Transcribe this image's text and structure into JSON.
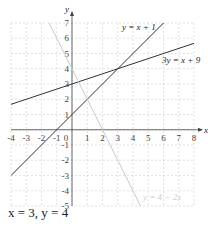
{
  "chart_data": {
    "type": "line",
    "title": "",
    "xlabel": "x",
    "ylabel": "y",
    "xlim": [
      -4,
      8
    ],
    "ylim": [
      -5,
      7
    ],
    "grid": true,
    "x_ticks": [
      -4,
      -3,
      -2,
      -1,
      0,
      1,
      2,
      3,
      4,
      5,
      6,
      7,
      8
    ],
    "y_ticks": [
      -5,
      -4,
      -3,
      -2,
      -1,
      1,
      2,
      3,
      4,
      5,
      6,
      7
    ],
    "series": [
      {
        "name": "y = x + 1",
        "equation": "y = x + 1",
        "color": "#333333",
        "points": [
          [
            -4,
            -3
          ],
          [
            6,
            7
          ]
        ]
      },
      {
        "name": "3y = x + 9",
        "equation": "3y = x + 9",
        "color": "#333333",
        "points": [
          [
            -4,
            1.667
          ],
          [
            8,
            5.667
          ]
        ]
      },
      {
        "name": "y = 4 − 2x",
        "equation": "y = 4 - 2x",
        "color": "#c8c8c8",
        "points": [
          [
            -1.5,
            7
          ],
          [
            4.5,
            -5
          ]
        ]
      }
    ],
    "intersection": {
      "x": 3,
      "y": 4
    }
  },
  "labels": {
    "x_axis": "x",
    "y_axis": "y",
    "line1": "y = x + 1",
    "line2": "3y = x + 9",
    "line3": "y = 4 − 2x",
    "answer": "x = 3, y = 4"
  }
}
